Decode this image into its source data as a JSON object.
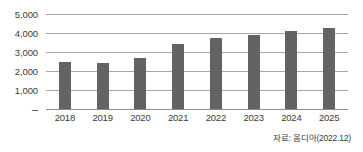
{
  "chart_data": {
    "type": "bar",
    "title": "",
    "subtitle": "",
    "xlabel": "",
    "ylabel": "",
    "categories": [
      "2018",
      "2019",
      "2020",
      "2021",
      "2022",
      "2023",
      "2024",
      "2025"
    ],
    "values": [
      2500,
      2400,
      2700,
      3400,
      3750,
      3900,
      4100,
      4250
    ],
    "series": [
      {
        "name": "",
        "values": [
          2500,
          2400,
          2700,
          3400,
          3750,
          3900,
          4100,
          4250
        ]
      }
    ],
    "ylim": [
      0,
      5000
    ],
    "ytick_values": [
      5000,
      4000,
      3000,
      2000,
      1000,
      0
    ],
    "ytick_labels": [
      "5,000",
      "4,000",
      "3,000",
      "2,000",
      "1,000",
      "–"
    ],
    "grid": true,
    "legend": false,
    "legend_position": "none",
    "annotations": [
      "자료: 옴디아(2022.12)"
    ],
    "bar_color": "#636363",
    "gridline_color": "#a6a6a6",
    "axis_text_color": "#3b3b3b",
    "background_color": "#ffffff"
  },
  "footer": {
    "source_note": "자료: 옴디아(2022.12)"
  }
}
